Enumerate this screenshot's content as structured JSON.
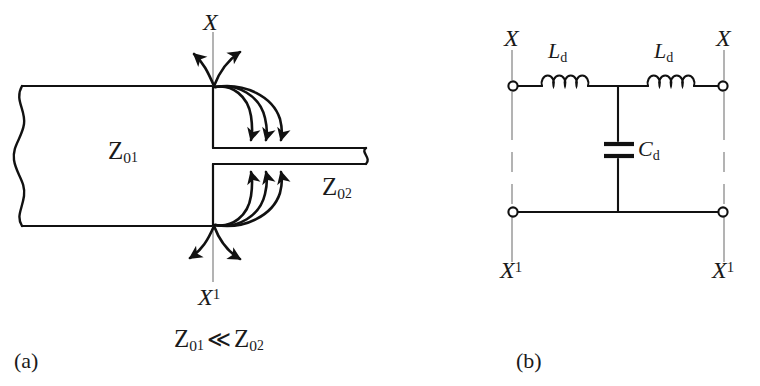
{
  "figure": {
    "panels": [
      {
        "id": "panel-a",
        "caption": "(a)",
        "description": "Step discontinuity between two transmission lines with fringing field lines",
        "labels": {
          "reference_plane_top": "X",
          "reference_plane_bottom_base": "X",
          "reference_plane_bottom_sup": "1",
          "impedance_wide_base": "Z",
          "impedance_wide_sub0": "0",
          "impedance_wide_sub1": "1",
          "impedance_narrow_base": "Z",
          "impedance_narrow_sub0": "0",
          "impedance_narrow_sub2": "2",
          "condition_lhs_base": "Z",
          "condition_lhs_sub0": "0",
          "condition_lhs_sub1": "1",
          "condition_operator": "≪",
          "condition_rhs_base": "Z",
          "condition_rhs_sub0": "0",
          "condition_rhs_sub2": "2"
        },
        "field_lines": {
          "top_fringe_count": 3,
          "bottom_fringe_count": 3,
          "top_diverging_arrows": 2,
          "bottom_diverging_arrows": 2
        }
      },
      {
        "id": "panel-b",
        "caption": "(b)",
        "description": "Equivalent T-network circuit model of the discontinuity",
        "labels": {
          "terminal_top_left": "X",
          "terminal_top_right": "X",
          "terminal_bottom_left_base": "X",
          "terminal_bottom_left_sup": "1",
          "terminal_bottom_right_base": "X",
          "terminal_bottom_right_sup": "1",
          "inductor_left_base": "L",
          "inductor_left_sub": "d",
          "inductor_right_base": "L",
          "inductor_right_sub": "d",
          "capacitor_base": "C",
          "capacitor_sub": "d"
        },
        "components": {
          "inductors": 2,
          "capacitors": 1,
          "terminals": 4,
          "inductor_coil_loops": 4
        }
      }
    ]
  },
  "colors": {
    "ink": "#1a1a1a",
    "line": "#111111",
    "reference_line": "#8a8a8a",
    "background": "#ffffff"
  }
}
